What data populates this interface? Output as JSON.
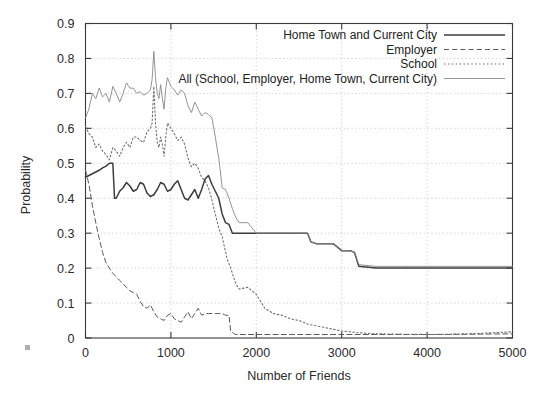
{
  "chart_data": {
    "type": "line",
    "title": "",
    "xlabel": "Number of Friends",
    "ylabel": "Probability",
    "xlim": [
      0,
      5000
    ],
    "ylim": [
      0,
      0.9
    ],
    "grid": true,
    "legend_position": "top-right",
    "xticks": [
      0,
      1000,
      2000,
      3000,
      4000,
      5000
    ],
    "xtick_labels": [
      "0",
      "1000",
      "2000",
      "3000",
      "4000",
      "5000"
    ],
    "yticks": [
      0,
      0.1,
      0.2,
      0.3,
      0.4,
      0.5,
      0.6,
      0.7,
      0.8,
      0.9
    ],
    "ytick_labels": [
      "0",
      "0.1",
      "0.2",
      "0.3",
      "0.4",
      "0.5",
      "0.6",
      "0.7",
      "0.8",
      "0.9"
    ],
    "series": [
      {
        "name": "Home Town and Current City",
        "style": "solid",
        "color": "#3c3c3c",
        "width": 1.5,
        "x": [
          0,
          40,
          80,
          120,
          160,
          200,
          240,
          280,
          320,
          340,
          360,
          400,
          440,
          480,
          520,
          560,
          600,
          640,
          680,
          720,
          760,
          800,
          840,
          880,
          920,
          960,
          1000,
          1040,
          1080,
          1120,
          1160,
          1200,
          1240,
          1280,
          1320,
          1360,
          1400,
          1440,
          1480,
          1520,
          1560,
          1600,
          1640,
          1680,
          1720,
          1760,
          1800,
          1900,
          2000,
          2200,
          2400,
          2600,
          2640,
          2700,
          2900,
          3000,
          3100,
          3150,
          3200,
          3400,
          3700,
          4000,
          4400,
          4700,
          5000
        ],
        "y": [
          0.46,
          0.465,
          0.47,
          0.475,
          0.48,
          0.487,
          0.492,
          0.5,
          0.5,
          0.4,
          0.4,
          0.42,
          0.43,
          0.445,
          0.435,
          0.42,
          0.425,
          0.445,
          0.44,
          0.415,
          0.405,
          0.41,
          0.425,
          0.445,
          0.44,
          0.42,
          0.425,
          0.44,
          0.45,
          0.425,
          0.4,
          0.395,
          0.41,
          0.425,
          0.4,
          0.425,
          0.455,
          0.465,
          0.44,
          0.42,
          0.4,
          0.355,
          0.33,
          0.325,
          0.3,
          0.3,
          0.3,
          0.3,
          0.3,
          0.3,
          0.3,
          0.3,
          0.275,
          0.27,
          0.27,
          0.25,
          0.25,
          0.245,
          0.205,
          0.2,
          0.2,
          0.2,
          0.2,
          0.2,
          0.2
        ]
      },
      {
        "name": "Employer",
        "style": "dashed",
        "color": "#5a5a5a",
        "width": 1.0,
        "x": [
          0,
          40,
          80,
          120,
          160,
          200,
          240,
          280,
          320,
          360,
          400,
          440,
          480,
          520,
          560,
          600,
          640,
          680,
          720,
          760,
          800,
          840,
          880,
          920,
          960,
          1000,
          1040,
          1080,
          1120,
          1160,
          1200,
          1240,
          1280,
          1320,
          1360,
          1400,
          1440,
          1480,
          1520,
          1560,
          1600,
          1640,
          1680,
          1700,
          1740,
          1760,
          1800,
          2000,
          2400,
          3000,
          3600,
          4200,
          5000
        ],
        "y": [
          0.48,
          0.44,
          0.38,
          0.33,
          0.285,
          0.245,
          0.215,
          0.2,
          0.185,
          0.175,
          0.165,
          0.155,
          0.145,
          0.135,
          0.13,
          0.125,
          0.105,
          0.09,
          0.085,
          0.095,
          0.075,
          0.06,
          0.055,
          0.05,
          0.065,
          0.07,
          0.055,
          0.05,
          0.045,
          0.06,
          0.075,
          0.055,
          0.07,
          0.085,
          0.065,
          0.07,
          0.07,
          0.07,
          0.07,
          0.07,
          0.07,
          0.065,
          0.065,
          0.02,
          0.012,
          0.01,
          0.01,
          0.01,
          0.01,
          0.01,
          0.01,
          0.01,
          0.012
        ]
      },
      {
        "name": "School",
        "style": "dotted",
        "color": "#707070",
        "width": 1.1,
        "x": [
          0,
          40,
          80,
          120,
          160,
          200,
          240,
          280,
          320,
          360,
          400,
          440,
          480,
          520,
          560,
          600,
          640,
          680,
          720,
          760,
          780,
          800,
          820,
          840,
          860,
          880,
          900,
          920,
          940,
          960,
          1000,
          1040,
          1080,
          1120,
          1160,
          1200,
          1240,
          1280,
          1320,
          1360,
          1400,
          1440,
          1480,
          1520,
          1560,
          1600,
          1660,
          1700,
          1760,
          1800,
          1900,
          2000,
          2100,
          2200,
          2300,
          2400,
          2500,
          2600,
          2700,
          2800,
          2900,
          3000,
          3200,
          3400,
          3700,
          4000,
          4300,
          4600,
          4850,
          5000
        ],
        "y": [
          0.605,
          0.585,
          0.575,
          0.545,
          0.555,
          0.535,
          0.525,
          0.51,
          0.545,
          0.535,
          0.52,
          0.545,
          0.56,
          0.545,
          0.575,
          0.575,
          0.565,
          0.56,
          0.59,
          0.6,
          0.615,
          0.72,
          0.615,
          0.56,
          0.545,
          0.575,
          0.555,
          0.52,
          0.575,
          0.615,
          0.6,
          0.585,
          0.565,
          0.575,
          0.555,
          0.515,
          0.49,
          0.5,
          0.485,
          0.46,
          0.45,
          0.43,
          0.395,
          0.355,
          0.315,
          0.29,
          0.225,
          0.2,
          0.155,
          0.14,
          0.145,
          0.125,
          0.085,
          0.07,
          0.065,
          0.055,
          0.05,
          0.04,
          0.035,
          0.03,
          0.025,
          0.02,
          0.015,
          0.012,
          0.011,
          0.01,
          0.011,
          0.013,
          0.016,
          0.018
        ]
      },
      {
        "name": "All (School, Employer, Home Town, Current City)",
        "style": "thin-solid",
        "color": "#888888",
        "width": 0.9,
        "x": [
          0,
          40,
          80,
          120,
          160,
          200,
          240,
          280,
          320,
          360,
          400,
          440,
          480,
          520,
          560,
          600,
          640,
          680,
          720,
          760,
          780,
          800,
          820,
          840,
          860,
          880,
          900,
          920,
          940,
          960,
          1000,
          1040,
          1080,
          1120,
          1160,
          1200,
          1240,
          1280,
          1320,
          1360,
          1400,
          1440,
          1480,
          1520,
          1560,
          1580,
          1600,
          1640,
          1680,
          1720,
          1760,
          1800,
          1900,
          2000,
          2200,
          2400,
          2600,
          2640,
          2700,
          2900,
          3000,
          3100,
          3150,
          3200,
          3400,
          3700,
          4000,
          4400,
          4700,
          5000
        ],
        "y": [
          0.63,
          0.655,
          0.7,
          0.685,
          0.715,
          0.69,
          0.7,
          0.675,
          0.72,
          0.7,
          0.675,
          0.7,
          0.73,
          0.715,
          0.715,
          0.7,
          0.705,
          0.695,
          0.7,
          0.71,
          0.74,
          0.82,
          0.745,
          0.7,
          0.685,
          0.725,
          0.685,
          0.655,
          0.715,
          0.745,
          0.72,
          0.71,
          0.695,
          0.71,
          0.7,
          0.665,
          0.645,
          0.675,
          0.655,
          0.635,
          0.645,
          0.64,
          0.63,
          0.575,
          0.515,
          0.475,
          0.43,
          0.425,
          0.4,
          0.37,
          0.345,
          0.33,
          0.33,
          0.3,
          0.3,
          0.3,
          0.3,
          0.275,
          0.27,
          0.27,
          0.25,
          0.25,
          0.245,
          0.21,
          0.205,
          0.205,
          0.205,
          0.205,
          0.205,
          0.205
        ]
      }
    ]
  },
  "legend": {
    "items": [
      {
        "label": "Home Town and Current City",
        "style": "solid"
      },
      {
        "label": "Employer",
        "style": "dashed"
      },
      {
        "label": "School",
        "style": "dotted"
      },
      {
        "label": "All (School, Employer, Home Town, Current City)",
        "style": "thin-solid"
      }
    ]
  }
}
